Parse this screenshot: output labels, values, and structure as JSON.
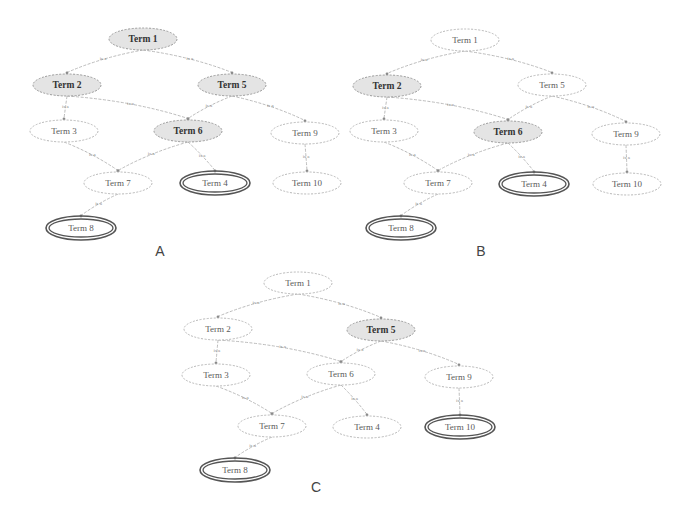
{
  "figure": {
    "edge_label": "is a",
    "node_rx": 34,
    "node_ry": 11,
    "colors": {
      "shaded_fill": "#e4e4e4",
      "plain_fill": "#ffffff",
      "plain_stroke": "#b8b8b8",
      "target_stroke": "#555555",
      "edge_stroke": "#b3b3b3"
    },
    "edges": [
      [
        "t1",
        "t2"
      ],
      [
        "t1",
        "t5"
      ],
      [
        "t2",
        "t3"
      ],
      [
        "t2",
        "t6"
      ],
      [
        "t5",
        "t6"
      ],
      [
        "t5",
        "t9"
      ],
      [
        "t3",
        "t7"
      ],
      [
        "t6",
        "t7"
      ],
      [
        "t6",
        "t4"
      ],
      [
        "t9",
        "t10"
      ],
      [
        "t7",
        "t8"
      ]
    ],
    "panels": [
      {
        "id": "A",
        "label": "A",
        "label_pos": [
          160,
          251
        ],
        "nodes": {
          "t1": {
            "label": "Term 1",
            "x": 143,
            "y": 39,
            "style": "shaded"
          },
          "t2": {
            "label": "Term 2",
            "x": 67,
            "y": 85,
            "style": "shaded"
          },
          "t5": {
            "label": "Term 5",
            "x": 232,
            "y": 85,
            "style": "shaded"
          },
          "t3": {
            "label": "Term 3",
            "x": 64,
            "y": 131,
            "style": "plain"
          },
          "t6": {
            "label": "Term 6",
            "x": 188,
            "y": 131,
            "style": "shaded"
          },
          "t9": {
            "label": "Term 9",
            "x": 305,
            "y": 133,
            "style": "plain"
          },
          "t7": {
            "label": "Term 7",
            "x": 118,
            "y": 183,
            "style": "plain"
          },
          "t4": {
            "label": "Term 4",
            "x": 215,
            "y": 183,
            "style": "target"
          },
          "t10": {
            "label": "Term 10",
            "x": 307,
            "y": 183,
            "style": "plain"
          },
          "t8": {
            "label": "Term 8",
            "x": 81,
            "y": 228,
            "style": "target"
          }
        }
      },
      {
        "id": "B",
        "label": "B",
        "label_pos": [
          481,
          251
        ],
        "nodes": {
          "t1": {
            "label": "Term 1",
            "x": 465,
            "y": 40,
            "style": "plain"
          },
          "t2": {
            "label": "Term 2",
            "x": 387,
            "y": 86,
            "style": "shaded"
          },
          "t5": {
            "label": "Term 5",
            "x": 552,
            "y": 85,
            "style": "plain"
          },
          "t3": {
            "label": "Term 3",
            "x": 384,
            "y": 131,
            "style": "plain"
          },
          "t6": {
            "label": "Term 6",
            "x": 508,
            "y": 132,
            "style": "shaded"
          },
          "t9": {
            "label": "Term 9",
            "x": 626,
            "y": 134,
            "style": "plain"
          },
          "t7": {
            "label": "Term 7",
            "x": 438,
            "y": 183,
            "style": "plain"
          },
          "t4": {
            "label": "Term 4",
            "x": 534,
            "y": 184,
            "style": "target"
          },
          "t10": {
            "label": "Term 10",
            "x": 627,
            "y": 184,
            "style": "plain"
          },
          "t8": {
            "label": "Term 8",
            "x": 401,
            "y": 228,
            "style": "target"
          }
        }
      },
      {
        "id": "C",
        "label": "C",
        "label_pos": [
          316,
          487
        ],
        "nodes": {
          "t1": {
            "label": "Term 1",
            "x": 298,
            "y": 283,
            "style": "plain"
          },
          "t2": {
            "label": "Term 2",
            "x": 218,
            "y": 329,
            "style": "plain"
          },
          "t5": {
            "label": "Term 5",
            "x": 381,
            "y": 330,
            "style": "shaded"
          },
          "t3": {
            "label": "Term 3",
            "x": 216,
            "y": 375,
            "style": "plain"
          },
          "t6": {
            "label": "Term 6",
            "x": 341,
            "y": 374,
            "style": "plain"
          },
          "t9": {
            "label": "Term 9",
            "x": 459,
            "y": 377,
            "style": "plain"
          },
          "t7": {
            "label": "Term 7",
            "x": 272,
            "y": 426,
            "style": "plain"
          },
          "t4": {
            "label": "Term 4",
            "x": 367,
            "y": 427,
            "style": "plain"
          },
          "t10": {
            "label": "Term 10",
            "x": 460,
            "y": 427,
            "style": "target"
          },
          "t8": {
            "label": "Term 8",
            "x": 235,
            "y": 470,
            "style": "target"
          }
        }
      }
    ]
  }
}
